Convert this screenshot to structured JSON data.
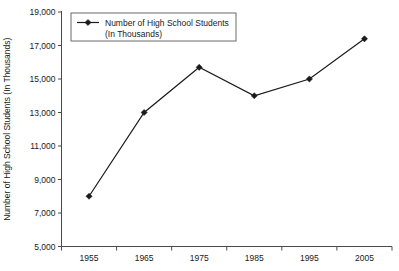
{
  "chart_data": {
    "type": "line",
    "title": "",
    "subtitle": "",
    "xlabel": "",
    "ylabel": "Number of High School Students (In Thousands)",
    "categories": [
      "1955",
      "1965",
      "1975",
      "1985",
      "1995",
      "2005"
    ],
    "series": [
      {
        "name": "Number of High School Students (In Thousands)",
        "values": [
          8000,
          13000,
          15700,
          14000,
          15000,
          17400
        ],
        "marker": "diamond",
        "color": "#1a1a1a"
      }
    ],
    "ylim": [
      5000,
      19000
    ],
    "ytick_step": 2000,
    "ytick_labels": [
      "5,000",
      "7,000",
      "9,000",
      "11,000",
      "13,000",
      "15,000",
      "17,000",
      "19,000"
    ],
    "ytick_values": [
      5000,
      7000,
      9000,
      11000,
      13000,
      15000,
      17000,
      19000
    ],
    "xtick_labels": [
      "1955",
      "1965",
      "1975",
      "1985",
      "1995",
      "2005"
    ],
    "grid": false,
    "legend_position": "top-left-inside",
    "legend_entries": [
      {
        "line1": "Number of High School Students",
        "line2": "(In Thousands)"
      }
    ],
    "background_color": "#ffffff",
    "axis_color": "#4a4a4a",
    "text_color": "#1a1a1a"
  }
}
